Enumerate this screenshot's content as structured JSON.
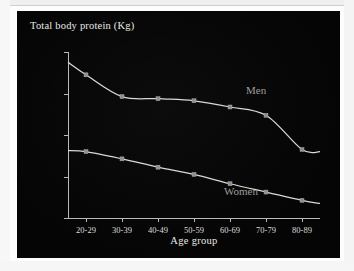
{
  "chart_data": {
    "type": "line",
    "title": "Total body protein (Kg)",
    "xlabel": "Age group",
    "ylabel": "Total body protein (Kg)",
    "categories": [
      "20-29",
      "30-39",
      "40-49",
      "50-59",
      "60-69",
      "70-79",
      "80-89"
    ],
    "yticks": [
      6,
      8,
      10,
      12,
      14
    ],
    "ylim": [
      6,
      14
    ],
    "grid": false,
    "legend": "inline-labels",
    "series": [
      {
        "name": "Men",
        "values": [
          12.9,
          11.85,
          11.75,
          11.65,
          11.35,
          10.95,
          9.3
        ],
        "curve_start_y": 13.5,
        "curve_end_y": 9.2
      },
      {
        "name": "Women",
        "values": [
          9.2,
          8.85,
          8.45,
          8.1,
          7.65,
          7.25,
          6.85
        ],
        "curve_start_y": 9.25,
        "curve_end_y": 6.7
      }
    ],
    "annotations": [
      {
        "text": "Men",
        "near_category": "60-69"
      },
      {
        "text": "Women",
        "near_category": "60-69"
      }
    ]
  },
  "panel": {
    "background_color": "#050505",
    "axis_color": "#b9b9b6",
    "text_color": "#e8e8e6",
    "series_color": "#d8d8d4",
    "label_color": "#9d9d99"
  }
}
